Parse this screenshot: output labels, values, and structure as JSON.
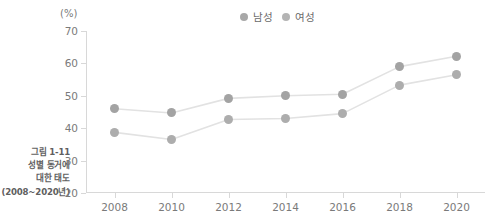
{
  "caption": {
    "line1": "그림 1-11",
    "line2": "성별 동거에",
    "line3": "대한 태도",
    "line4": "(2008~2020년)"
  },
  "axis": {
    "y_unit": "(%)"
  },
  "legend": {
    "items": [
      {
        "label": "남성",
        "color": "#a8a8a8"
      },
      {
        "label": "여성",
        "color": "#b4b4b4"
      }
    ]
  },
  "colors": {
    "marker_male": "#a3a3a3",
    "marker_female": "#adadad",
    "line": "#e2e2e2",
    "axis": "#d8d8d8",
    "text": "#7a7a7a"
  },
  "chart_data": {
    "type": "line",
    "title": "성별 동거에 대한 태도",
    "xlabel": "",
    "ylabel": "(%)",
    "x": [
      2008,
      2010,
      2012,
      2014,
      2016,
      2018,
      2020
    ],
    "xticklabels": [
      "2008",
      "2010",
      "2012",
      "2014",
      "2016",
      "2018",
      "2020"
    ],
    "yticks": [
      20,
      30,
      40,
      50,
      60,
      70
    ],
    "yticklabels": [
      "20",
      "30",
      "40",
      "50",
      "60",
      "70"
    ],
    "ylim": [
      20,
      70
    ],
    "xlim": [
      2007,
      2021
    ],
    "grid": false,
    "legend_position": "top-center",
    "series": [
      {
        "name": "남성",
        "values": [
          46.0,
          44.7,
          49.2,
          50.0,
          50.5,
          59.0,
          62.2
        ]
      },
      {
        "name": "여성",
        "values": [
          38.7,
          36.5,
          42.7,
          43.0,
          44.5,
          53.3,
          56.5
        ]
      }
    ]
  }
}
